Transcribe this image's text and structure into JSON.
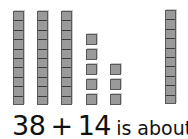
{
  "problem": {
    "addend1": "38",
    "operator": "+",
    "addend2": "14",
    "suffix": "is about"
  },
  "blocks": {
    "left_tens_rods": 3,
    "left_ones_cubes": 8,
    "right_tens_rods": 1,
    "block_color": "#9a9a9a"
  }
}
